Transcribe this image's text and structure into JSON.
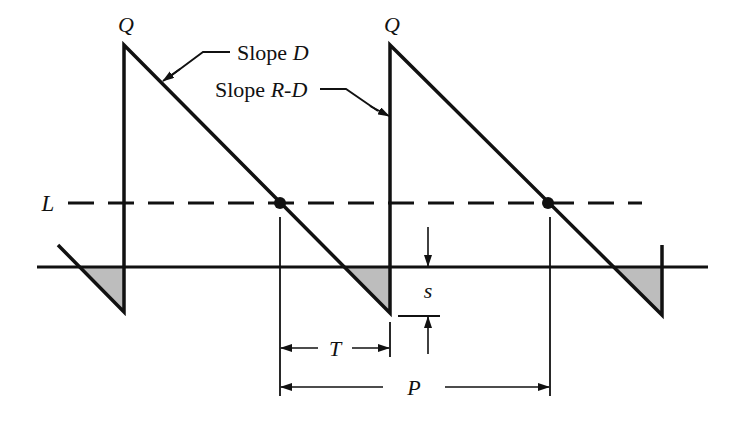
{
  "diagram": {
    "labels": {
      "q_left": "Q",
      "q_right": "Q",
      "slope_d_prefix": "Slope ",
      "slope_d_var": "D",
      "slope_rd_prefix": "Slope ",
      "slope_rd_var": "R-D",
      "reorder_level": "L",
      "safety_stock": "s",
      "lead_time": "T",
      "period": "P"
    },
    "colors": {
      "line": "#111111",
      "shade": "#bdbdbd",
      "background": "#ffffff"
    }
  }
}
